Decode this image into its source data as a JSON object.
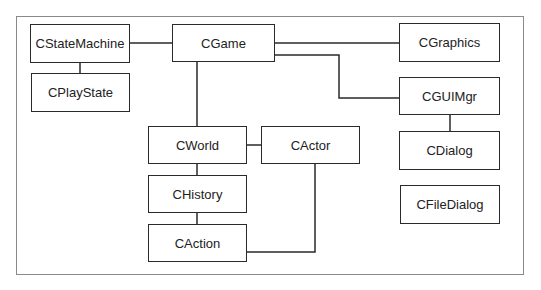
{
  "diagram": {
    "type": "class-relationship",
    "nodes": [
      {
        "id": "cstatemachine",
        "label": "CStateMachine"
      },
      {
        "id": "cplaystate",
        "label": "CPlayState"
      },
      {
        "id": "cgame",
        "label": "CGame"
      },
      {
        "id": "cgraphics",
        "label": "CGraphics"
      },
      {
        "id": "cguimgr",
        "label": "CGUIMgr"
      },
      {
        "id": "cdialog",
        "label": "CDialog"
      },
      {
        "id": "cfiledialog",
        "label": "CFileDialog"
      },
      {
        "id": "cworld",
        "label": "CWorld"
      },
      {
        "id": "cactor",
        "label": "CActor"
      },
      {
        "id": "chistory",
        "label": "CHistory"
      },
      {
        "id": "caction",
        "label": "CAction"
      }
    ],
    "edges": [
      {
        "from": "cstatemachine",
        "to": "cgame"
      },
      {
        "from": "cstatemachine",
        "to": "cplaystate"
      },
      {
        "from": "cgame",
        "to": "cgraphics"
      },
      {
        "from": "cgame",
        "to": "cguimgr"
      },
      {
        "from": "cgame",
        "to": "cworld"
      },
      {
        "from": "cguimgr",
        "to": "cdialog"
      },
      {
        "from": "cworld",
        "to": "cactor"
      },
      {
        "from": "cworld",
        "to": "chistory"
      },
      {
        "from": "chistory",
        "to": "caction"
      },
      {
        "from": "caction",
        "to": "cactor"
      }
    ]
  }
}
